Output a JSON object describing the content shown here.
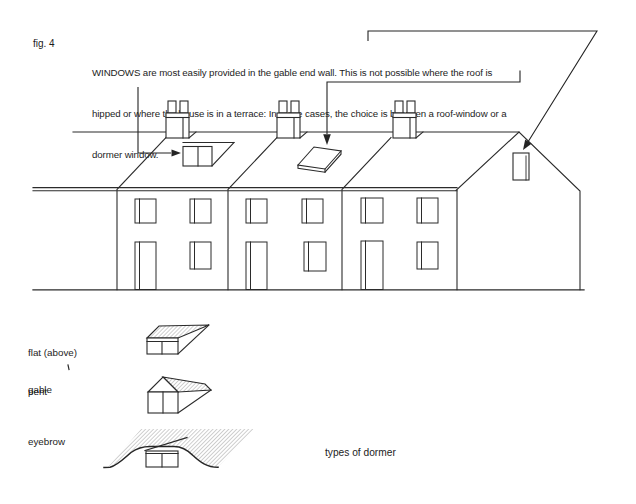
{
  "figure_label": "fig. 4",
  "caption": {
    "line1": "WINDOWS are most easily provided in the gable end wall. This is not possible where the roof is",
    "line2": "hipped or where the house is in a terrace: In these cases, the choice is between a roof-window or a",
    "line3": "dormer window."
  },
  "dormer_types": {
    "flat_label_line1": "flat (above)",
    "flat_label_line2": "pent",
    "gable_label": "gable",
    "eyebrow_label": "eyebrow",
    "caption": "types of dormer"
  },
  "colors": {
    "ink": "#1c1c1c",
    "line": "#2b2b2b",
    "paper": "#ffffff",
    "hatch": "#8f8f8f"
  }
}
